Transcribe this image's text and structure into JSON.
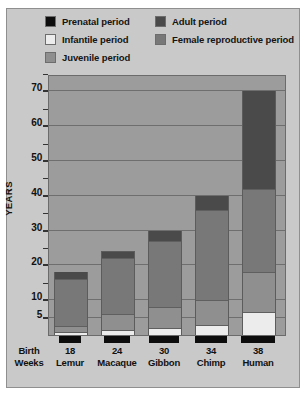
{
  "chart_data": {
    "type": "bar",
    "subtype": "stacked-bar",
    "title": "",
    "xlabel": "",
    "ylabel": "YEARS",
    "ylim": [
      0,
      75
    ],
    "yticks_labeled": [
      5,
      10,
      20,
      30,
      40,
      50,
      60,
      70
    ],
    "yticks_minor": [
      15,
      25,
      35,
      45,
      55,
      65,
      75
    ],
    "grid": true,
    "legend_position": "top",
    "categories": [
      "Lemur",
      "Macaque",
      "Gibbon",
      "Chimp",
      "Human"
    ],
    "gestation_weeks": [
      18,
      24,
      30,
      34,
      38
    ],
    "gestation_axis_label_line1": "Birth",
    "gestation_axis_label_line2": "Weeks",
    "series": [
      {
        "name": "Prenatal period",
        "color": "#0d0d0d",
        "note": "Shown as black bars below the axis, length proportional to gestation weeks",
        "values": [
          18,
          24,
          30,
          34,
          38
        ],
        "units": "weeks"
      },
      {
        "name": "Infantile period",
        "color": "#ececec",
        "values": [
          1.0,
          1.5,
          2.0,
          3.0,
          6.5
        ],
        "units": "years"
      },
      {
        "name": "Juvenile period",
        "color": "#8f8f8f",
        "values": [
          1.5,
          4.5,
          6.0,
          7.0,
          11.5
        ],
        "units": "years"
      },
      {
        "name": "Female reproductive period",
        "color": "#787878",
        "values": [
          13.5,
          16.0,
          19.0,
          26.0,
          24.0
        ],
        "units": "years"
      },
      {
        "name": "Adult period",
        "color": "#4a4a4a",
        "values": [
          2.0,
          2.0,
          3.0,
          4.0,
          28.0
        ],
        "units": "years"
      }
    ],
    "totals_years": [
      18,
      24,
      30,
      40,
      70
    ],
    "legend_entries": [
      {
        "label": "Prenatal period",
        "color": "#0d0d0d",
        "column": "left"
      },
      {
        "label": "Infantile period",
        "color": "#ececec",
        "column": "left"
      },
      {
        "label": "Juvenile period",
        "color": "#8f8f8f",
        "column": "left"
      },
      {
        "label": "Adult period",
        "color": "#4a4a4a",
        "column": "right"
      },
      {
        "label": "Female reproductive period",
        "color": "#787878",
        "column": "right"
      }
    ]
  },
  "legend": {
    "left": [
      {
        "label": "Prenatal period",
        "color": "#0d0d0d"
      },
      {
        "label": "Infantile period",
        "color": "#ececec"
      },
      {
        "label": "Juvenile period",
        "color": "#8f8f8f"
      }
    ],
    "right": [
      {
        "label": "Adult period",
        "color": "#4a4a4a"
      },
      {
        "label": "Female reproductive period",
        "color": "#787878"
      }
    ]
  },
  "yaxis": {
    "title": "YEARS",
    "labels": [
      "70",
      "60",
      "50",
      "40",
      "30",
      "20",
      "10",
      "5"
    ]
  },
  "xaxis": {
    "first_label_line1": "Birth",
    "first_label_line2": "Weeks",
    "groups": [
      {
        "weeks": "18",
        "name": "Lemur"
      },
      {
        "weeks": "24",
        "name": "Macaque"
      },
      {
        "weeks": "30",
        "name": "Gibbon"
      },
      {
        "weeks": "34",
        "name": "Chimp"
      },
      {
        "weeks": "38",
        "name": "Human"
      }
    ]
  },
  "colors": {
    "prenatal": "#0d0d0d",
    "infantile": "#ececec",
    "juvenile": "#8f8f8f",
    "adult": "#4a4a4a",
    "female_reproductive": "#787878",
    "plot_background": "#9c9c9c",
    "figure_background": "#c9c9c9"
  }
}
